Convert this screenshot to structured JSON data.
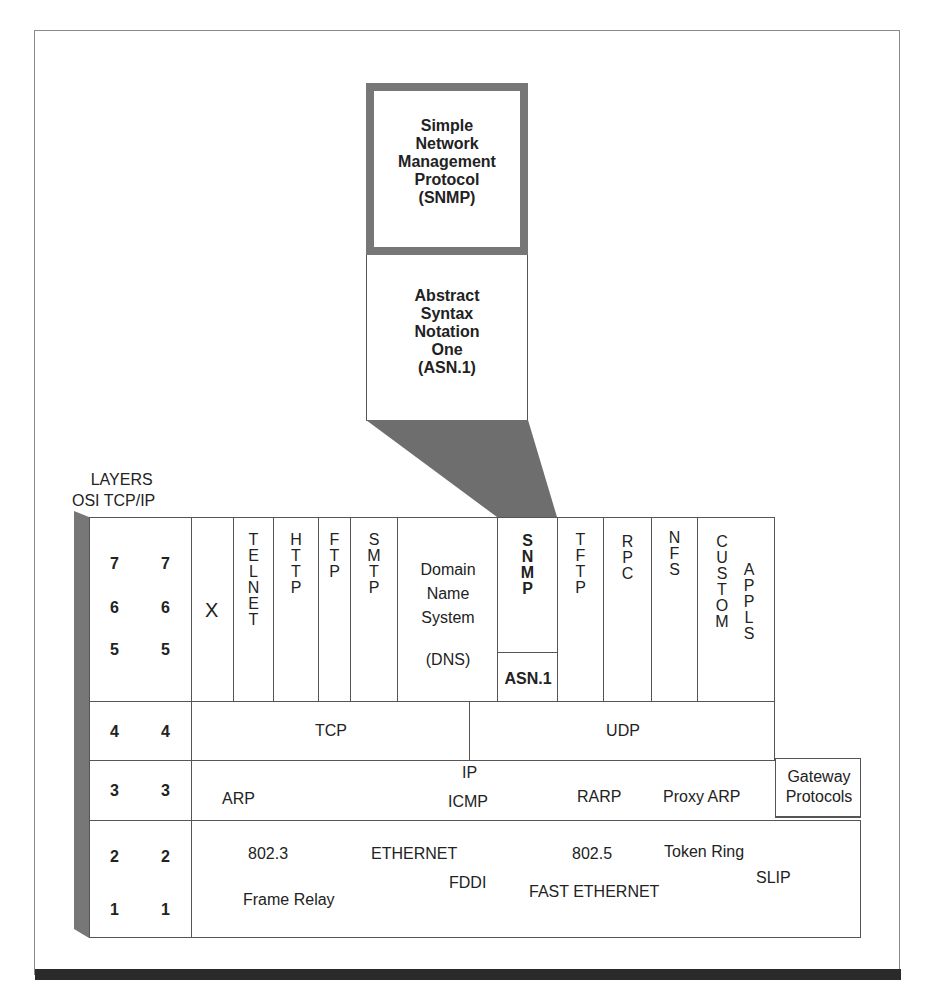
{
  "figure": {
    "snmp_box": {
      "lines": [
        "Simple",
        "Network",
        "Management",
        "Protocol",
        "(SNMP)"
      ]
    },
    "asn_box": {
      "lines": [
        "Abstract",
        "Syntax",
        "Notation",
        "One",
        "(ASN.1)"
      ]
    },
    "layers_header": {
      "title": "LAYERS",
      "columns": "OSI TCP/IP"
    },
    "layer_numbers": {
      "upper": {
        "osi": [
          "7",
          "6",
          "5"
        ],
        "tcpip": [
          "7",
          "6",
          "5"
        ]
      },
      "transport": {
        "osi": "4",
        "tcpip": "4"
      },
      "network": {
        "osi": "3",
        "tcpip": "3"
      },
      "link": {
        "osi": [
          "2",
          "1"
        ],
        "tcpip": [
          "2",
          "1"
        ]
      }
    },
    "application_row": [
      {
        "id": "x",
        "label": "X"
      },
      {
        "id": "telnet",
        "label": "TELNET"
      },
      {
        "id": "http",
        "label": "HTTP"
      },
      {
        "id": "ftp",
        "label": "FTP"
      },
      {
        "id": "smtp",
        "label": "SMTP"
      },
      {
        "id": "dns",
        "lines": [
          "Domain",
          "Name",
          "System",
          "(DNS)"
        ]
      },
      {
        "id": "snmp",
        "label": "SNMP",
        "sub": "ASN.1"
      },
      {
        "id": "tftp",
        "label": "TFTP"
      },
      {
        "id": "rpc",
        "label": "RPC"
      },
      {
        "id": "nfs",
        "label": "NFS"
      },
      {
        "id": "custom",
        "label": "CUSTOM",
        "label2": "APPLS"
      }
    ],
    "transport_row": {
      "tcp": "TCP",
      "udp": "UDP"
    },
    "network_row": {
      "arp": "ARP",
      "ip": "IP",
      "icmp": "ICMP",
      "rarp": "RARP",
      "proxy_arp": "Proxy ARP",
      "gateway": [
        "Gateway",
        "Protocols"
      ]
    },
    "link_row": {
      "items": [
        "802.3",
        "ETHERNET",
        "FDDI",
        "Frame Relay",
        "802.5",
        "Token Ring",
        "FAST ETHERNET",
        "SLIP"
      ]
    }
  }
}
